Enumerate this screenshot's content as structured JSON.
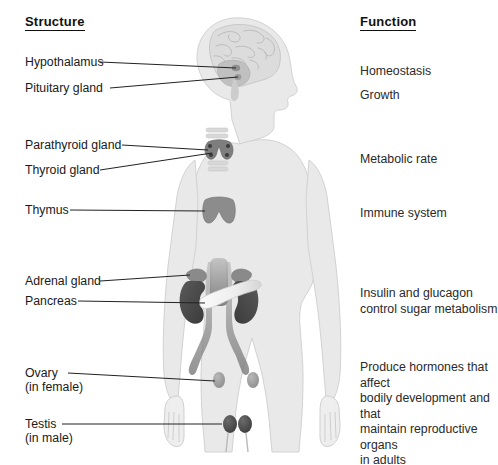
{
  "headings": {
    "structure": "Structure",
    "function": "Function"
  },
  "structures": [
    {
      "name": "hypothalamus",
      "label": "Hypothalamus",
      "sub": ""
    },
    {
      "name": "pituitary-gland",
      "label": "Pituitary gland",
      "sub": ""
    },
    {
      "name": "parathyroid-gland",
      "label": "Parathyroid gland",
      "sub": ""
    },
    {
      "name": "thyroid-gland",
      "label": "Thyroid gland",
      "sub": ""
    },
    {
      "name": "thymus",
      "label": "Thymus",
      "sub": ""
    },
    {
      "name": "adrenal-gland",
      "label": "Adrenal gland",
      "sub": ""
    },
    {
      "name": "pancreas",
      "label": "Pancreas",
      "sub": ""
    },
    {
      "name": "ovary",
      "label": "Ovary",
      "sub": "(in female)"
    },
    {
      "name": "testis",
      "label": "Testis",
      "sub": "(in male)"
    }
  ],
  "functions": [
    {
      "name": "homeostasis",
      "text": "Homeostasis"
    },
    {
      "name": "growth",
      "text": "Growth"
    },
    {
      "name": "metabolic-rate",
      "text": "Metabolic rate"
    },
    {
      "name": "immune-system",
      "text": "Immune system"
    },
    {
      "name": "insulin-glucagon",
      "text": "Insulin and glucagon\ncontrol sugar metabolism"
    },
    {
      "name": "reproductive",
      "text": "Produce hormones that affect\nbodily development and that\nmaintain reproductive organs\nin adults"
    }
  ],
  "colors": {
    "body_fill": "#e9e9e9",
    "body_stroke": "#cfcfcf",
    "organ_dark": "#4a4a4a",
    "organ_mid": "#8c8c8c",
    "organ_light": "#f2f2f2",
    "leader_line": "#222222",
    "text": "#1a1a1a",
    "background": "#ffffff"
  },
  "organs": [
    {
      "name": "brain",
      "tone": "light-gray"
    },
    {
      "name": "hypothalamus",
      "tone": "mid-gray"
    },
    {
      "name": "pituitary-gland",
      "tone": "mid-gray"
    },
    {
      "name": "thyroid-gland",
      "tone": "mid-gray"
    },
    {
      "name": "parathyroid-gland",
      "tone": "dark-gray"
    },
    {
      "name": "thymus",
      "tone": "mid-gray"
    },
    {
      "name": "adrenal-gland",
      "tone": "mid-gray"
    },
    {
      "name": "kidney",
      "tone": "dark-gray"
    },
    {
      "name": "pancreas",
      "tone": "light-gray"
    },
    {
      "name": "aorta",
      "tone": "mid-gray"
    },
    {
      "name": "ovary",
      "tone": "mid-gray"
    },
    {
      "name": "testis",
      "tone": "dark-gray"
    }
  ]
}
